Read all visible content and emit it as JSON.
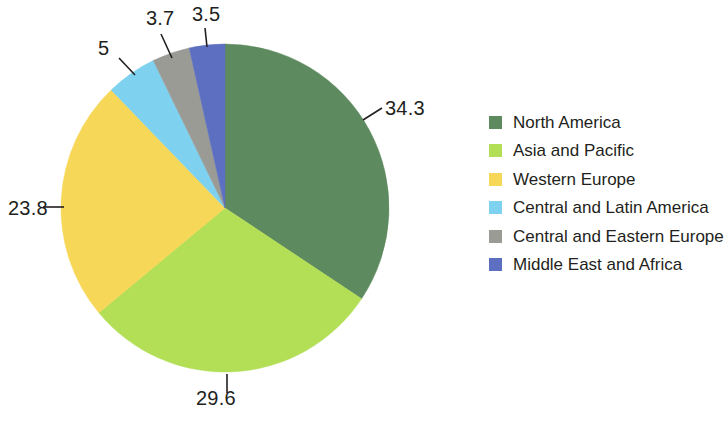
{
  "chart_data": {
    "type": "pie",
    "title": "",
    "subtitle": "",
    "xlabel": "",
    "ylabel": "",
    "grid": false,
    "legend_position": "right",
    "start_angle_deg": 0,
    "direction": "clockwise",
    "total": 99.9,
    "categories": [
      "North America",
      "Asia and Pacific",
      "Western Europe",
      "Central and Latin America",
      "Central and Eastern Europe",
      "Middle East and Africa"
    ],
    "values": [
      34.3,
      29.6,
      23.8,
      5,
      3.7,
      3.5
    ],
    "value_labels": [
      "34.3",
      "29.6",
      "23.8",
      "5",
      "3.7",
      "3.5"
    ],
    "colors": [
      "#5d8a5e",
      "#b3df57",
      "#f7d757",
      "#7ed2f0",
      "#9b9b96",
      "#5c6fc0"
    ],
    "slices": [
      {
        "label": "North America",
        "value": 34.3,
        "value_label": "34.3",
        "color": "#5d8a5e"
      },
      {
        "label": "Asia and Pacific",
        "value": 29.6,
        "value_label": "29.6",
        "color": "#b3df57"
      },
      {
        "label": "Western Europe",
        "value": 23.8,
        "value_label": "23.8",
        "color": "#f7d757"
      },
      {
        "label": "Central and Latin America",
        "value": 5,
        "value_label": "5",
        "color": "#7ed2f0"
      },
      {
        "label": "Central and Eastern Europe",
        "value": 3.7,
        "value_label": "3.7",
        "color": "#9b9b96"
      },
      {
        "label": "Middle East and Africa",
        "value": 3.5,
        "value_label": "3.5",
        "color": "#5c6fc0"
      }
    ]
  },
  "legend": {
    "items": [
      {
        "label": "North America",
        "color": "#5d8a5e"
      },
      {
        "label": "Asia and Pacific",
        "color": "#b3df57"
      },
      {
        "label": "Western Europe",
        "color": "#f7d757"
      },
      {
        "label": "Central and Latin America",
        "color": "#7ed2f0"
      },
      {
        "label": "Central and Eastern Europe",
        "color": "#9b9b96"
      },
      {
        "label": "Middle East and Africa",
        "color": "#5c6fc0"
      }
    ]
  },
  "geometry": {
    "center_x": 225,
    "center_y": 208,
    "radius": 164
  }
}
